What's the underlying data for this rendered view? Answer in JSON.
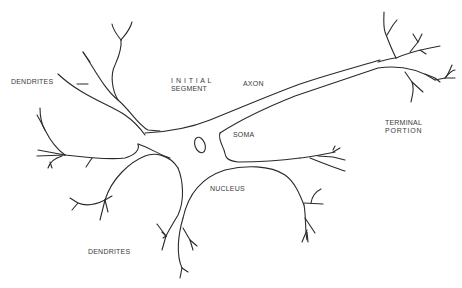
{
  "diagram": {
    "type": "neuron-anatomy",
    "stroke_color": "#2a2a2a",
    "background": "#ffffff",
    "labels": {
      "dendrites_top": "DENDRITES",
      "initial_segment_line1": "I N I T I A L",
      "initial_segment_line2": "SEGMENT",
      "axon": "AXON",
      "soma": "SOMA",
      "terminal_line1": "TERMINAL",
      "terminal_line2": "PORTION",
      "nucleus": "NUCLEUS",
      "dendrites_bottom": "DENDRITES"
    },
    "structures": [
      "dendrites-upper-left",
      "dendrites-left",
      "dendrites-lower",
      "soma",
      "nucleus-outline",
      "axon",
      "terminal-branches"
    ]
  }
}
